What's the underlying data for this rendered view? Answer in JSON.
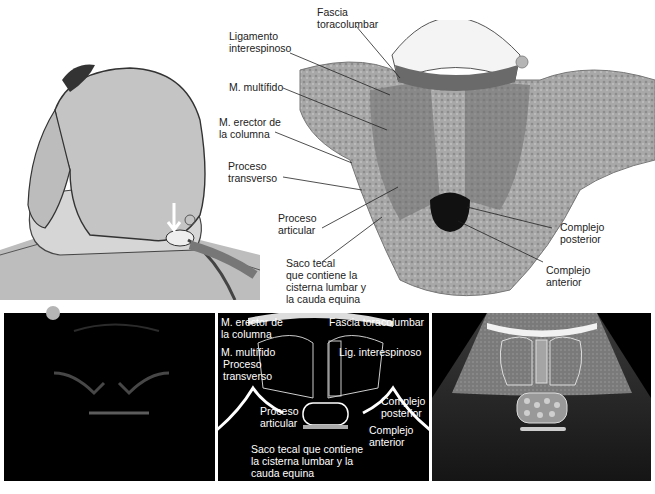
{
  "top_section": {
    "illustration": "patient-seated-back-probe",
    "anatomy_labels": {
      "fascia": "Fascia\ntoracolumbar",
      "ligamento": "Ligamento\ninterespinoso",
      "multifido": "M. multífido",
      "erector": "M. erector de\nla columna",
      "transverso": "Proceso\ntransverso",
      "articular": "Proceso\narticular",
      "saco": "Saco tecal\nque contiene la\ncisterna lumbar y\nla cauda equina",
      "posterior": "Complejo\nposterior",
      "anterior": "Complejo\nanterior"
    }
  },
  "bottom_section": {
    "panel_left": "raw-ultrasound-image",
    "panel_middle_labels": {
      "erector": "M. erector de\nla columna",
      "fascia": "Fascia toracolumbar",
      "multifido": "M. multífido",
      "lig": "Lig. interespinoso",
      "transverso": "Proceso\ntransverso",
      "articular": "Proceso\narticular",
      "posterior": "Complejo\nposterior",
      "anterior": "Complejo\nanterior",
      "saco": "Saco tecal que contiene\nla cisterna lumbar y la\ncauda equina"
    },
    "panel_right": "schematic-ultrasound-illustration"
  },
  "colors": {
    "label_text": "#222222",
    "panel_bg": "#000000",
    "marker_dot": "#b5b5b5",
    "skin": "#c8c8c8",
    "tissue": "#9a9a9a"
  }
}
